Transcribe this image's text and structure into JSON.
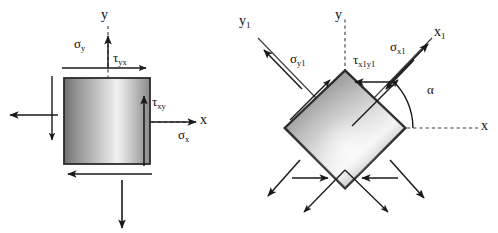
{
  "figure": {
    "background_color": "#ffffff",
    "stroke_color": "#1a1a1a",
    "element_fill_dark": "#6e6e6e",
    "element_fill_light": "#f2f2f2",
    "element_edge_color": "#2b2b2b"
  },
  "left_diagram": {
    "name": "original-stress-element",
    "axes": {
      "x_label": "x",
      "y_label": "y"
    },
    "labels": {
      "sigma_y": {
        "symbol": "σ",
        "sub": "y"
      },
      "tau_yx": {
        "symbol": "τ",
        "sub": "yx"
      },
      "tau_xy": {
        "symbol": "τ",
        "sub": "xy"
      },
      "sigma_x": {
        "symbol": "σ",
        "sub": "x"
      }
    },
    "arrows": [
      "sigma-x-right",
      "sigma-x-left",
      "sigma-y-up",
      "sigma-y-down",
      "tau-yx-top-right",
      "tau-xy-right-up",
      "tau-bottom-left",
      "tau-left-down"
    ]
  },
  "right_diagram": {
    "name": "rotated-stress-element",
    "axes": {
      "x_label": "x",
      "y_label": "y",
      "x1_label": {
        "symbol": "x",
        "sub": "1"
      },
      "y1_label": {
        "symbol": "y",
        "sub": "1"
      }
    },
    "labels": {
      "sigma_y1": {
        "symbol": "σ",
        "sub": "y1"
      },
      "tau_x1y1": {
        "symbol": "τ",
        "sub": "x1y1"
      },
      "sigma_x1": {
        "symbol": "σ",
        "sub": "x1"
      },
      "alpha": {
        "symbol": "α"
      }
    },
    "arrows": [
      "sigma-x1-outward",
      "sigma-x1-inward",
      "sigma-y1-outward",
      "sigma-y1-inward",
      "tau-x1y1-upper-right",
      "tau-x1y1-upper-left",
      "tau-lower-left",
      "tau-lower-right"
    ]
  }
}
